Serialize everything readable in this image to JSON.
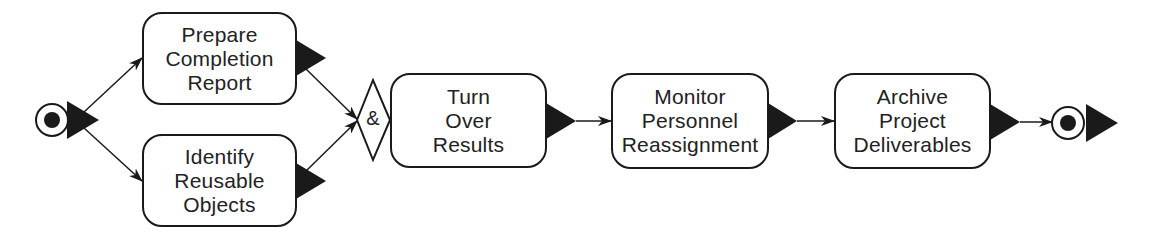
{
  "diagram": {
    "type": "activity-diagram",
    "start_node": {
      "label": ""
    },
    "end_node": {
      "label": ""
    },
    "activities": [
      {
        "id": "prepare",
        "lines": [
          "Prepare",
          "Completion",
          "Report"
        ]
      },
      {
        "id": "identify",
        "lines": [
          "Identify",
          "Reusable",
          "Objects"
        ]
      },
      {
        "id": "turnover",
        "lines": [
          "Turn",
          "Over",
          "Results"
        ]
      },
      {
        "id": "monitor",
        "lines": [
          "Monitor",
          "Personnel",
          "Reassignment"
        ]
      },
      {
        "id": "archive",
        "lines": [
          "Archive",
          "Project",
          "Deliverables"
        ]
      }
    ],
    "join": {
      "symbol": "&"
    },
    "flows": [
      {
        "from": "start",
        "to": "prepare"
      },
      {
        "from": "start",
        "to": "identify"
      },
      {
        "from": "prepare",
        "to": "join"
      },
      {
        "from": "identify",
        "to": "join"
      },
      {
        "from": "join",
        "to": "turnover"
      },
      {
        "from": "turnover",
        "to": "monitor"
      },
      {
        "from": "monitor",
        "to": "archive"
      },
      {
        "from": "archive",
        "to": "end"
      }
    ],
    "colors": {
      "stroke": "#1a1a1a",
      "fill": "#ffffff",
      "text": "#222222"
    }
  }
}
